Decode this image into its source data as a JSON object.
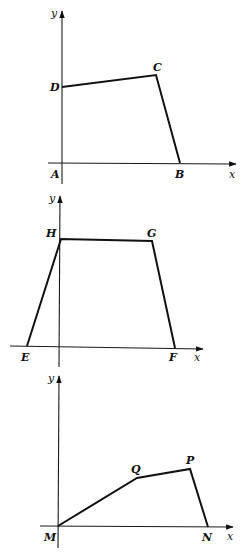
{
  "diagrams": [
    {
      "id": "ABCD",
      "axes": {
        "x_label": "x",
        "y_label": "y"
      },
      "points": {
        "A": {
          "label": "A",
          "x": 62,
          "y": 163
        },
        "B": {
          "label": "B",
          "x": 180,
          "y": 163
        },
        "C": {
          "label": "C",
          "x": 156,
          "y": 75
        },
        "D": {
          "label": "D",
          "x": 62,
          "y": 87
        }
      },
      "path_order": [
        "D",
        "C",
        "B"
      ]
    },
    {
      "id": "EFGH",
      "axes": {
        "x_label": "x",
        "y_label": "y"
      },
      "points": {
        "E": {
          "label": "E",
          "x": 27,
          "y": 346
        },
        "F": {
          "label": "F",
          "x": 175,
          "y": 348
        },
        "G": {
          "label": "G",
          "x": 152,
          "y": 241
        },
        "H": {
          "label": "H",
          "x": 61,
          "y": 239
        }
      },
      "path_order": [
        "E",
        "H",
        "G",
        "F"
      ]
    },
    {
      "id": "MNPQ",
      "axes": {
        "x_label": "x",
        "y_label": "y"
      },
      "points": {
        "M": {
          "label": "M",
          "x": 58,
          "y": 526
        },
        "N": {
          "label": "N",
          "x": 208,
          "y": 527
        },
        "P": {
          "label": "P",
          "x": 190,
          "y": 469
        },
        "Q": {
          "label": "Q",
          "x": 137,
          "y": 478
        }
      },
      "path_order": [
        "M",
        "Q",
        "P",
        "N"
      ]
    }
  ]
}
